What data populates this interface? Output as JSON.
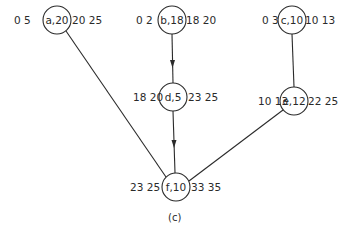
{
  "diagram": {
    "caption": "(c)",
    "nodes": [
      {
        "id": "a",
        "label": "a,20",
        "left": "0 5",
        "right": "20 25",
        "x": 57,
        "y": 20
      },
      {
        "id": "b",
        "label": "b,18",
        "left": "0 2",
        "right": "18 20",
        "x": 172,
        "y": 20
      },
      {
        "id": "c",
        "label": "c,10",
        "left": "0 3",
        "right": "10 13",
        "x": 292,
        "y": 20
      },
      {
        "id": "d",
        "label": "d,5",
        "left": "18 20",
        "right": "23 25",
        "x": 173,
        "y": 97
      },
      {
        "id": "e",
        "label": "e,12",
        "left": "10 13",
        "right": "22 25",
        "x": 294,
        "y": 101
      },
      {
        "id": "f",
        "label": "f,10",
        "left": "23 25",
        "right": "33 35",
        "x": 176,
        "y": 187
      }
    ],
    "edges": [
      {
        "from": "a",
        "to": "f",
        "arrow": false
      },
      {
        "from": "b",
        "to": "d",
        "arrow": true
      },
      {
        "from": "d",
        "to": "f",
        "arrow": true
      },
      {
        "from": "c",
        "to": "e",
        "arrow": false
      },
      {
        "from": "e",
        "to": "f",
        "arrow": false
      }
    ]
  }
}
